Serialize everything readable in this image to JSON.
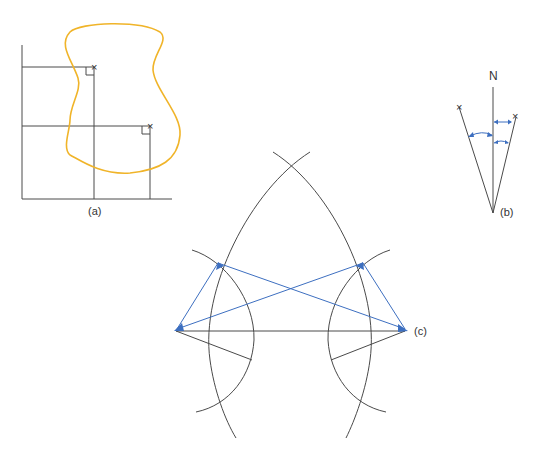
{
  "figure": {
    "panels": [
      {
        "id": "a",
        "label": "(a)",
        "description": "Offset measurements to points on irregular boundary"
      },
      {
        "id": "b",
        "label": "(b)",
        "north_label": "N",
        "description": "Bearings measured from north"
      },
      {
        "id": "c",
        "label": "(c)",
        "description": "Triangulation by arc intersection"
      }
    ],
    "colors": {
      "boundary": "#f0b429",
      "construction": "#4a4a4a",
      "measurement": "#3d6fc0"
    },
    "markers": {
      "point_symbol": "×"
    }
  }
}
